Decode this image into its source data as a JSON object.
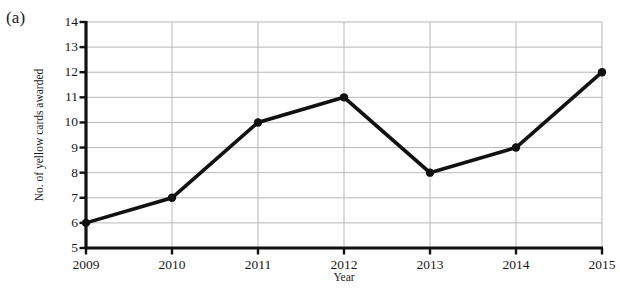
{
  "figure": {
    "panel_label": "(a)",
    "background_color": "#ffffff",
    "ink_color": "#1a1a1a",
    "grid_color": "#b8b8b8"
  },
  "chart_data": {
    "type": "line",
    "title": "",
    "subtitle": "",
    "xlabel": "Year",
    "ylabel": "No. of yellow cards awarded",
    "categories": [
      "2009",
      "2010",
      "2011",
      "2012",
      "2013",
      "2014",
      "2015"
    ],
    "x": [
      2009,
      2010,
      2011,
      2012,
      2013,
      2014,
      2015
    ],
    "values": [
      6,
      7,
      10,
      11,
      8,
      9,
      12
    ],
    "series": [
      {
        "name": "No. of yellow cards awarded",
        "values": [
          6,
          7,
          10,
          11,
          8,
          9,
          12
        ]
      }
    ],
    "xlim": [
      2009,
      2015
    ],
    "ylim": [
      5,
      14
    ],
    "x_tick_labels": [
      "2009",
      "2010",
      "2011",
      "2012",
      "2013",
      "2014",
      "2015"
    ],
    "y_tick_labels": [
      "5",
      "6",
      "7",
      "8",
      "9",
      "10",
      "11",
      "12",
      "13",
      "14"
    ],
    "y_ticks": [
      5,
      6,
      7,
      8,
      9,
      10,
      11,
      12,
      13,
      14
    ],
    "grid": "both",
    "legend": "none",
    "line_color": "#111111",
    "marker": "filled-circle",
    "marker_color": "#111111",
    "annotations": []
  }
}
